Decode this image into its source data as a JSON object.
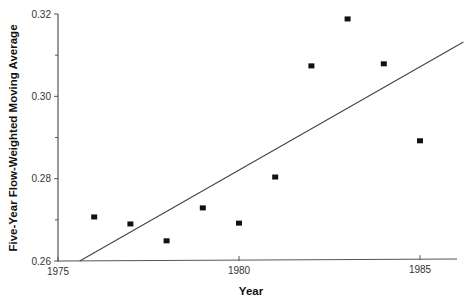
{
  "chart_data": {
    "type": "scatter",
    "title": "",
    "xlabel": "Year",
    "ylabel": "Five-Year Flow-Weighted Moving Average",
    "xlim": [
      1975,
      1986.2
    ],
    "ylim": [
      0.26,
      0.32
    ],
    "grid": false,
    "legend": null,
    "x_ticks": [
      "1975",
      "1980",
      "1985"
    ],
    "y_ticks": [
      "0.26",
      "0.28",
      "0.30",
      "0.32"
    ],
    "x_tick_values": [
      1975,
      1980,
      1985
    ],
    "y_tick_values": [
      0.26,
      0.28,
      0.3,
      0.32
    ],
    "y_minor_tick_values": [
      0.27,
      0.29,
      0.31
    ],
    "series": [
      {
        "name": "Moving average",
        "marker": "square",
        "x": [
          1976,
          1977,
          1978,
          1979,
          1980,
          1981,
          1982,
          1983,
          1984,
          1985
        ],
        "values": [
          0.2707,
          0.269,
          0.2649,
          0.2729,
          0.2692,
          0.2804,
          0.3074,
          0.3188,
          0.3079,
          0.2892
        ]
      }
    ],
    "trend_line": {
      "name": "Linear trend",
      "x": [
        1975.6,
        1986.2
      ],
      "values": [
        0.26,
        0.3132
      ]
    }
  }
}
